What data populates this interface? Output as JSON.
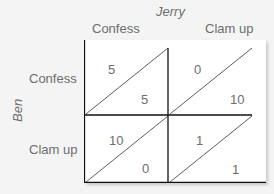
{
  "column_player": "Jerry",
  "row_player": "Ben",
  "columns": [
    "Confess",
    "Clam up"
  ],
  "rows": [
    "Confess",
    "Clam up"
  ],
  "payoffs": [
    [
      {
        "ben": "5",
        "jerry": "5"
      },
      {
        "ben": "0",
        "jerry": "10"
      }
    ],
    [
      {
        "ben": "10",
        "jerry": "0"
      },
      {
        "ben": "1",
        "jerry": "1"
      }
    ]
  ]
}
